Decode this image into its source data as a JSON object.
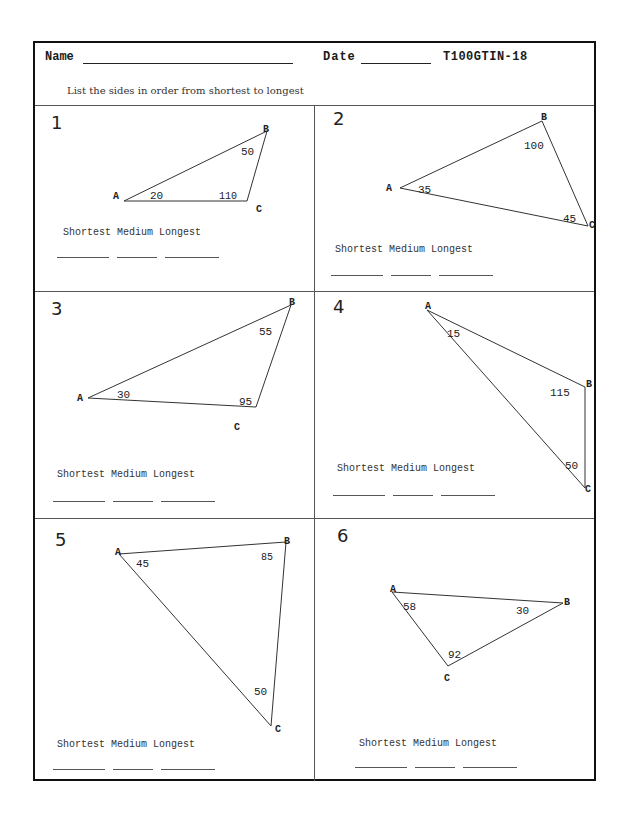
{
  "header": {
    "name_label": "Name",
    "date_label": "Date",
    "code": "T100GTIN-18",
    "instructions": "List the sides in order from shortest to longest"
  },
  "answer_labels": {
    "shortest": "Shortest",
    "medium": "Medium",
    "longest": "Longest"
  },
  "problems": [
    {
      "number": "1",
      "vertices": {
        "A": "A",
        "B": "B",
        "C": "C"
      },
      "angles": {
        "A": "20",
        "B": "50",
        "C": "110"
      }
    },
    {
      "number": "2",
      "vertices": {
        "A": "A",
        "B": "B",
        "C": "C"
      },
      "angles": {
        "A": "35",
        "B": "100",
        "C": "45"
      }
    },
    {
      "number": "3",
      "vertices": {
        "A": "A",
        "B": "B",
        "C": "C"
      },
      "angles": {
        "A": "30",
        "B": "55",
        "C": "95"
      }
    },
    {
      "number": "4",
      "vertices": {
        "A": "A",
        "B": "B",
        "C": "C"
      },
      "angles": {
        "A": "15",
        "B": "115",
        "C": "50"
      }
    },
    {
      "number": "5",
      "vertices": {
        "A": "A",
        "B": "B",
        "C": "C"
      },
      "angles": {
        "A": "45",
        "B": "85",
        "C": "50"
      }
    },
    {
      "number": "6",
      "vertices": {
        "A": "A",
        "B": "B",
        "C": "C"
      },
      "angles": {
        "A": "58",
        "B": "30",
        "C": "92"
      }
    }
  ]
}
